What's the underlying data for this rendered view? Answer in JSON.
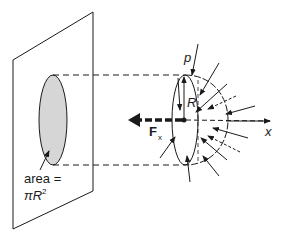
{
  "diagram": {
    "labels": {
      "pressure": "p",
      "radius": "R",
      "force": "F",
      "force_subscript": "x",
      "axis": "x",
      "area_line1": "area =",
      "area_pi": "π",
      "area_R": "R",
      "area_exp": "2"
    },
    "colors": {
      "stroke": "#1a1a1a",
      "shaded_area": "#d6d6d6",
      "background": "#ffffff"
    }
  }
}
